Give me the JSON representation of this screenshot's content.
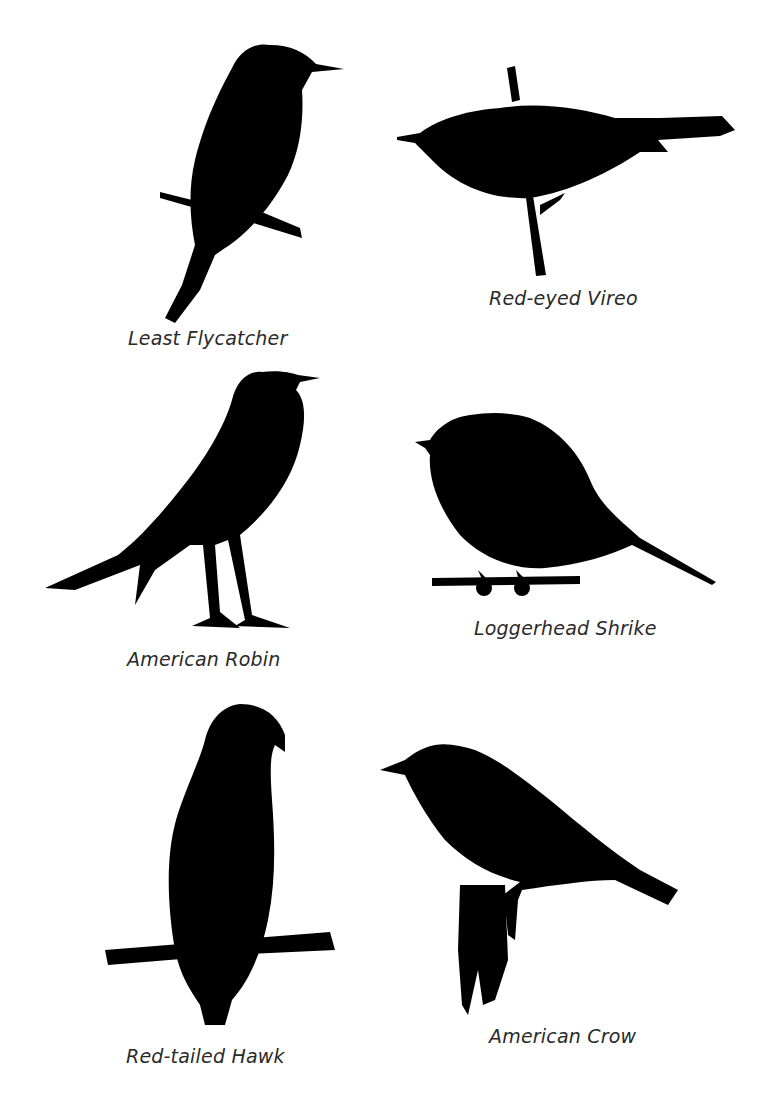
{
  "page": {
    "background": "#ffffff",
    "silhouette_color": "#000000",
    "label_color": "#2a2a2a"
  },
  "birds": [
    {
      "id": "least-flycatcher",
      "label": "Least Flycatcher"
    },
    {
      "id": "red-eyed-vireo",
      "label": "Red-eyed Vireo"
    },
    {
      "id": "american-robin",
      "label": "American Robin"
    },
    {
      "id": "loggerhead-shrike",
      "label": "Loggerhead Shrike"
    },
    {
      "id": "red-tailed-hawk",
      "label": "Red-tailed Hawk"
    },
    {
      "id": "american-crow",
      "label": "American Crow"
    }
  ]
}
